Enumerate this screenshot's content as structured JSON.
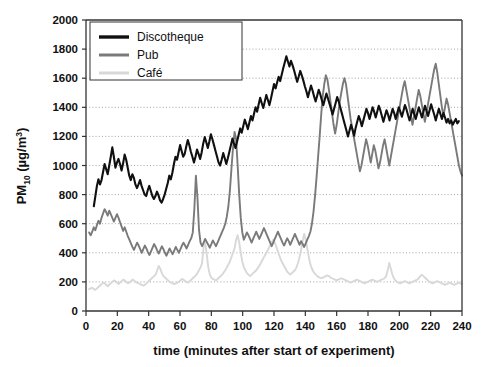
{
  "chart_data": {
    "type": "line",
    "title": "",
    "xlabel": "time (minutes after start of experiment)",
    "ylabel_main": "PM",
    "ylabel_sub": "10",
    "ylabel_unit_pre": " (µg/m",
    "ylabel_unit_sup": "3",
    "ylabel_unit_post": ")",
    "ylabel_full": "PM10 (µg/m³)",
    "xlim": [
      0,
      240
    ],
    "ylim": [
      0,
      2000
    ],
    "xticks": [
      0,
      20,
      40,
      60,
      80,
      100,
      120,
      140,
      160,
      180,
      200,
      220,
      240
    ],
    "yticks": [
      0,
      200,
      400,
      600,
      800,
      1000,
      1200,
      1400,
      1600,
      1800,
      2000
    ],
    "grid": "horizontal-dotted",
    "legend_position": "top-left-inside",
    "colors": {
      "discotheque": "#101010",
      "pub": "#7a7a7a",
      "cafe": "#d8d8d8",
      "axis": "#333333",
      "grid": "#9a9a9a"
    },
    "series": [
      {
        "name": "Discotheque",
        "color": "#101010",
        "x_start": 5,
        "x_end": 238,
        "values": [
          720,
          790,
          860,
          905,
          870,
          900,
          955,
          1010,
          975,
          940,
          1000,
          1060,
          1125,
          1060,
          985,
          1020,
          1045,
          1010,
          965,
          1015,
          1075,
          1040,
          985,
          930,
          900,
          940,
          915,
          870,
          845,
          870,
          900,
          860,
          830,
          800,
          790,
          830,
          860,
          825,
          790,
          770,
          790,
          820,
          795,
          760,
          745,
          770,
          800,
          840,
          880,
          930,
          905,
          950,
          1010,
          1060,
          1040,
          1090,
          1140,
          1100,
          1060,
          1080,
          1130,
          1175,
          1140,
          1095,
          1060,
          1020,
          1060,
          1110,
          1080,
          1045,
          1090,
          1150,
          1195,
          1160,
          1120,
          1165,
          1215,
          1180,
          1140,
          1100,
          1060,
          1020,
          1000,
          1040,
          1085,
          1050,
          1010,
          1050,
          1095,
          1140,
          1185,
          1150,
          1120,
          1165,
          1210,
          1255,
          1225,
          1270,
          1315,
          1285,
          1250,
          1295,
          1340,
          1310,
          1355,
          1400,
          1370,
          1420,
          1465,
          1430,
          1395,
          1440,
          1485,
          1450,
          1415,
          1460,
          1510,
          1560,
          1530,
          1570,
          1610,
          1580,
          1625,
          1670,
          1710,
          1750,
          1715,
          1680,
          1720,
          1690,
          1655,
          1615,
          1575,
          1610,
          1650,
          1620,
          1585,
          1545,
          1510,
          1470,
          1510,
          1550,
          1515,
          1475,
          1440,
          1480,
          1520,
          1490,
          1450,
          1415,
          1455,
          1495,
          1460,
          1425,
          1390,
          1350,
          1390,
          1430,
          1470,
          1440,
          1400,
          1360,
          1320,
          1280,
          1240,
          1200,
          1240,
          1280,
          1245,
          1205,
          1260,
          1300,
          1340,
          1310,
          1270,
          1310,
          1350,
          1390,
          1360,
          1320,
          1360,
          1400,
          1370,
          1330,
          1370,
          1410,
          1380,
          1340,
          1300,
          1340,
          1380,
          1350,
          1310,
          1350,
          1390,
          1360,
          1320,
          1360,
          1400,
          1370,
          1335,
          1375,
          1415,
          1385,
          1345,
          1310,
          1350,
          1390,
          1355,
          1320,
          1360,
          1400,
          1365,
          1330,
          1370,
          1410,
          1375,
          1340,
          1380,
          1420,
          1385,
          1350,
          1310,
          1350,
          1390,
          1355,
          1320,
          1360,
          1330,
          1295,
          1320,
          1290,
          1310,
          1280,
          1300,
          1320,
          1290,
          1305
        ]
      },
      {
        "name": "Pub",
        "color": "#7a7a7a",
        "x_start": 2,
        "x_end": 240,
        "values": [
          540,
          520,
          545,
          575,
          555,
          590,
          620,
          600,
          640,
          670,
          700,
          680,
          655,
          690,
          665,
          640,
          615,
          640,
          665,
          640,
          610,
          580,
          550,
          575,
          545,
          515,
          490,
          465,
          440,
          420,
          445,
          470,
          450,
          425,
          400,
          425,
          450,
          430,
          405,
          385,
          410,
          435,
          460,
          440,
          415,
          395,
          420,
          445,
          425,
          400,
          380,
          405,
          430,
          410,
          390,
          415,
          440,
          420,
          400,
          425,
          450,
          470,
          450,
          430,
          455,
          480,
          500,
          540,
          700,
          930,
          780,
          560,
          470,
          445,
          470,
          495,
          475,
          455,
          435,
          460,
          485,
          465,
          445,
          470,
          495,
          520,
          545,
          570,
          600,
          650,
          720,
          830,
          980,
          1120,
          1230,
          1180,
          1000,
          800,
          640,
          540,
          490,
          515,
          540,
          520,
          495,
          470,
          495,
          520,
          545,
          520,
          495,
          520,
          545,
          570,
          545,
          520,
          495,
          470,
          445,
          470,
          495,
          520,
          545,
          520,
          495,
          470,
          450,
          475,
          500,
          480,
          455,
          480,
          505,
          530,
          505,
          480,
          455,
          480,
          460,
          440,
          465,
          490,
          515,
          545,
          600,
          680,
          790,
          920,
          1060,
          1200,
          1350,
          1480,
          1560,
          1620,
          1590,
          1520,
          1440,
          1360,
          1280,
          1220,
          1280,
          1360,
          1440,
          1500,
          1560,
          1600,
          1560,
          1480,
          1400,
          1320,
          1260,
          1200,
          1140,
          1080,
          1020,
          960,
          1000,
          1060,
          1120,
          1180,
          1140,
          1080,
          1020,
          1080,
          1140,
          1100,
          1040,
          980,
          1020,
          1080,
          1140,
          1180,
          1120,
          1060,
          1000,
          1060,
          1120,
          1180,
          1240,
          1300,
          1360,
          1420,
          1480,
          1540,
          1580,
          1520,
          1460,
          1400,
          1340,
          1280,
          1340,
          1400,
          1460,
          1520,
          1480,
          1420,
          1360,
          1300,
          1360,
          1420,
          1480,
          1540,
          1600,
          1660,
          1700,
          1640,
          1560,
          1480,
          1400,
          1340,
          1400,
          1460,
          1420,
          1360,
          1300,
          1240,
          1180,
          1120,
          1060,
          1000,
          960,
          930
        ]
      },
      {
        "name": "Café",
        "color": "#d8d8d8",
        "x_start": 2,
        "x_end": 240,
        "values": [
          150,
          155,
          160,
          150,
          145,
          155,
          165,
          175,
          185,
          195,
          190,
          180,
          170,
          180,
          190,
          200,
          210,
          205,
          195,
          185,
          195,
          205,
          215,
          210,
          200,
          190,
          195,
          205,
          215,
          210,
          200,
          195,
          190,
          185,
          180,
          175,
          180,
          190,
          200,
          210,
          220,
          230,
          240,
          250,
          280,
          310,
          290,
          260,
          240,
          230,
          220,
          210,
          200,
          195,
          190,
          185,
          190,
          195,
          200,
          210,
          220,
          215,
          205,
          200,
          195,
          205,
          215,
          225,
          235,
          245,
          260,
          280,
          300,
          330,
          440,
          470,
          390,
          300,
          250,
          230,
          220,
          215,
          210,
          220,
          230,
          240,
          250,
          265,
          280,
          300,
          320,
          340,
          370,
          400,
          430,
          490,
          520,
          470,
          400,
          340,
          300,
          280,
          260,
          250,
          240,
          250,
          260,
          270,
          280,
          295,
          310,
          330,
          350,
          370,
          390,
          410,
          430,
          450,
          470,
          490,
          470,
          440,
          410,
          380,
          350,
          330,
          310,
          290,
          270,
          260,
          250,
          260,
          270,
          280,
          300,
          330,
          370,
          420,
          480,
          530,
          490,
          430,
          370,
          320,
          290,
          270,
          255,
          245,
          235,
          230,
          225,
          230,
          235,
          240,
          245,
          240,
          230,
          225,
          220,
          215,
          210,
          215,
          220,
          225,
          220,
          215,
          210,
          205,
          200,
          195,
          200,
          205,
          210,
          215,
          210,
          205,
          200,
          195,
          190,
          195,
          200,
          205,
          210,
          215,
          210,
          205,
          200,
          205,
          210,
          215,
          220,
          225,
          240,
          280,
          330,
          290,
          250,
          225,
          210,
          200,
          195,
          190,
          195,
          200,
          205,
          200,
          195,
          190,
          195,
          200,
          205,
          210,
          215,
          225,
          240,
          250,
          240,
          230,
          220,
          210,
          200,
          195,
          190,
          195,
          200,
          205,
          200,
          195,
          190,
          185,
          180,
          185,
          190,
          195,
          190,
          185,
          180,
          185,
          190,
          195,
          190,
          185
        ]
      }
    ]
  },
  "legend": {
    "items": [
      {
        "label": "Discotheque",
        "color": "#101010",
        "thickness": 3.4
      },
      {
        "label": "Pub",
        "color": "#7a7a7a",
        "thickness": 3.0
      },
      {
        "label": "Café",
        "color": "#d8d8d8",
        "thickness": 3.0
      }
    ]
  },
  "axes": {
    "x_title": "time (minutes after start of experiment)",
    "y_tick_labels": [
      "0",
      "200",
      "400",
      "600",
      "800",
      "1000",
      "1200",
      "1400",
      "1600",
      "1800",
      "2000"
    ],
    "x_tick_labels": [
      "0",
      "20",
      "40",
      "60",
      "80",
      "100",
      "120",
      "140",
      "160",
      "180",
      "200",
      "220",
      "240"
    ]
  }
}
